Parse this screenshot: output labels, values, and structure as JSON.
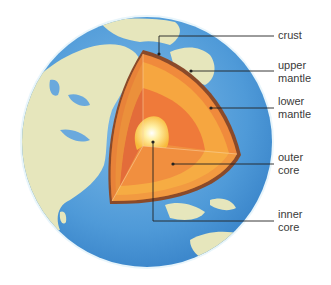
{
  "diagram": {
    "labels": [
      {
        "id": "crust",
        "line1": "crust",
        "line2": ""
      },
      {
        "id": "upper-mantle",
        "line1": "upper",
        "line2": "mantle"
      },
      {
        "id": "lower-mantle",
        "line1": "lower",
        "line2": "mantle"
      },
      {
        "id": "outer-core",
        "line1": "outer",
        "line2": "core"
      },
      {
        "id": "inner-core",
        "line1": "inner",
        "line2": "core"
      }
    ],
    "colors": {
      "ocean": "#5aa3dc",
      "land": "#e4e4b8",
      "crust": "#8a4a2a",
      "upper_mantle": "#f08a3c",
      "lower_mantle": "#f6a640",
      "outer_core": "#ef7a3a",
      "inner_core": "#ffe08a",
      "leader_line": "#222222"
    }
  }
}
